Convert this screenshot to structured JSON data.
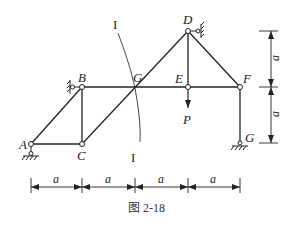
{
  "figure": {
    "caption": "图 2-18",
    "nodes": {
      "A": "A",
      "B": "B",
      "C": "C",
      "D": "D",
      "E": "E",
      "F": "F",
      "G_mid": "G",
      "G_support": "G"
    },
    "load": {
      "label": "P",
      "direction": "down",
      "at_node": "E"
    },
    "section": {
      "top_label": "I",
      "bottom_label": "I"
    },
    "dimensions": {
      "horizontal": [
        "a",
        "a",
        "a",
        "a"
      ],
      "vertical": [
        "a",
        "a"
      ]
    },
    "colors": {
      "line": "#222222",
      "background": "#ffffff"
    }
  }
}
